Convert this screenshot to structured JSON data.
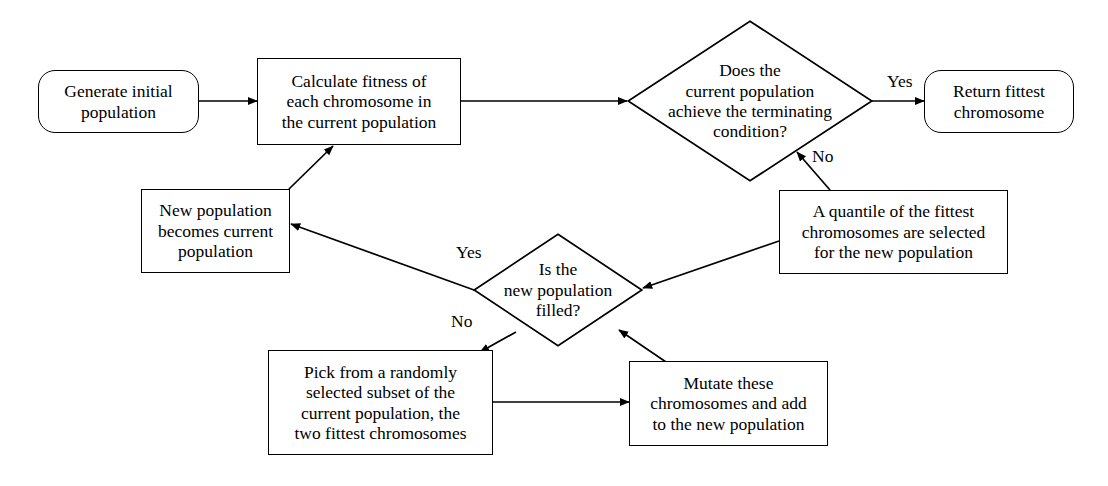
{
  "diagram": {
    "stroke_color": "#000000",
    "background_color": "#ffffff",
    "nodes": [
      {
        "id": "generate-initial-population",
        "shape": "rounded-rectangle",
        "text": "Generate initial\npopulation"
      },
      {
        "id": "calculate-fitness",
        "shape": "rectangle",
        "text": "Calculate fitness of\neach chromosome in\nthe current population"
      },
      {
        "id": "terminating-condition",
        "shape": "diamond",
        "text": "Does the\ncurrent population\nachieve the terminating\ncondition?"
      },
      {
        "id": "return-fittest-chromosome",
        "shape": "rounded-rectangle",
        "text": "Return fittest\nchromosome"
      },
      {
        "id": "quantile-selected",
        "shape": "rectangle",
        "text": "A quantile of the fittest\nchromosomes are selected\nfor the new population"
      },
      {
        "id": "new-population-becomes-current",
        "shape": "rectangle",
        "text": "New population\nbecomes current\npopulation"
      },
      {
        "id": "new-population-filled",
        "shape": "diamond",
        "text": "Is the\nnew population\nfilled?"
      },
      {
        "id": "pick-random-subset",
        "shape": "rectangle",
        "text": "Pick from a randomly\nselected subset of the\ncurrent population, the\ntwo fittest chromosomes"
      },
      {
        "id": "mutate-chromosomes",
        "shape": "rectangle",
        "text": "Mutate these\nchromosomes and add\nto the new population"
      }
    ],
    "edge_labels": {
      "terminating_yes": "Yes",
      "terminating_no": "No",
      "filled_yes": "Yes",
      "filled_no": "No"
    }
  }
}
